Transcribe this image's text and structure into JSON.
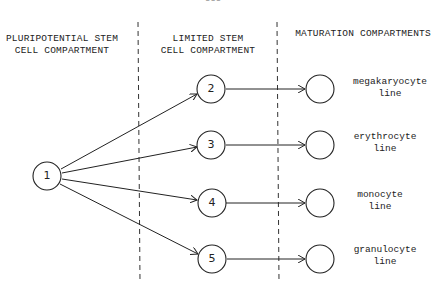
{
  "page_number": "555",
  "headers": {
    "pluripotential": [
      "PLURIPOTENTIAL STEM",
      "CELL COMPARTMENT"
    ],
    "limited": [
      "LIMITED STEM",
      "CELL COMPARTMENT"
    ],
    "maturation": "MATURATION COMPARTMENTS"
  },
  "nodes": {
    "source": {
      "label": "1"
    },
    "limited": [
      {
        "label": "2"
      },
      {
        "label": "3"
      },
      {
        "label": "4"
      },
      {
        "label": "5"
      }
    ]
  },
  "lines": [
    [
      "megakaryocyte",
      "line"
    ],
    [
      "erythrocyte",
      "line"
    ],
    [
      "monocyte",
      "line"
    ],
    [
      "granulocyte",
      "line"
    ]
  ],
  "colors": {
    "stroke": "#222222",
    "background": "#ffffff"
  }
}
